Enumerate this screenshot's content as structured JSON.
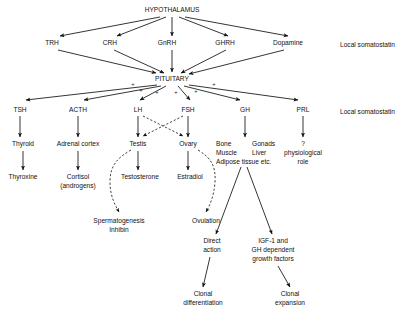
{
  "diagram": {
    "title_node": "HYPOTHALAMUS",
    "pituitary_node": "PITUITARY",
    "releasing_hormones": [
      {
        "label": "TRH"
      },
      {
        "label": "CRH"
      },
      {
        "label": "GnRH"
      },
      {
        "label": "GHRH"
      },
      {
        "label": "Dopamine"
      }
    ],
    "side_notes": [
      {
        "label": "Local somatostatin"
      },
      {
        "label": "Local somatostatin"
      }
    ],
    "pituitary_hormones": [
      {
        "label": "TSH"
      },
      {
        "label": "ACTH"
      },
      {
        "label": "LH"
      },
      {
        "label": "FSH"
      },
      {
        "label": "GH"
      },
      {
        "label": "PRL"
      }
    ],
    "plus_signs": [
      "+",
      "+",
      "+",
      "+",
      "+",
      "+"
    ],
    "targets": {
      "thyroid": "Thyroid",
      "adrenal_cortex": "Adrenal cortex",
      "testis": "Testis",
      "ovary": "Ovary",
      "gh_targets_col1": [
        "Bone",
        "Muscle",
        "Adipose tissue etc."
      ],
      "gh_targets_col2": [
        "Gonads",
        "Liver"
      ],
      "prl_target": [
        "?",
        "physiological",
        "role"
      ]
    },
    "products": {
      "thyroxine": "Thyroxine",
      "cortisol": [
        "Cortisol",
        "(androgens)"
      ],
      "testosterone": "Testosterone",
      "estradiol": "Estradiol"
    },
    "outcomes": {
      "spermatogenesis": [
        "Spermatogenesis",
        "Inhibin"
      ],
      "ovulation": "Ovulation",
      "direct_action": [
        "Direct",
        "action"
      ],
      "igf1": [
        "IGF-1 and",
        "GH dependent",
        "growth factors"
      ],
      "clonal_differentiation": [
        "Clonal",
        "differentiation"
      ],
      "clonal_expansion": [
        "Clonal",
        "expansion"
      ]
    },
    "colors": {
      "ink": "#111111",
      "background": "#ffffff"
    }
  }
}
